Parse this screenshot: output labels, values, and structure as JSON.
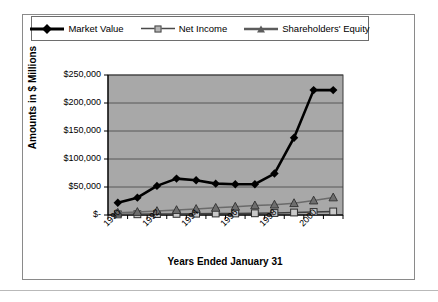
{
  "figure": {
    "legend": [
      {
        "label": "Market Value",
        "marker": "diamond-marker",
        "color": "#000000"
      },
      {
        "label": "Net Income",
        "marker": "square-marker",
        "color": "#b5b5b5"
      },
      {
        "label": "Shareholders' Equity",
        "marker": "triangle-marker",
        "color": "#5c5c5c"
      }
    ],
    "y_axis_title": "Amounts in $ Millions",
    "x_axis_title": "Years Ended January 31",
    "plot_background": "#a8a8a8",
    "gridline_color": "#4f4f4f",
    "frame_color": "#8a8a8a"
  },
  "chart_data": {
    "type": "line",
    "title": "",
    "xlabel": "Years Ended January 31",
    "ylabel": "Amounts in $ Millions",
    "x": [
      1990,
      1991,
      1992,
      1993,
      1994,
      1995,
      1996,
      1997,
      1998,
      1999,
      2000,
      2001
    ],
    "tick_labels_x": [
      "1990",
      "",
      "1992",
      "",
      "1994",
      "",
      "1996",
      "",
      "1998",
      "",
      "2000",
      ""
    ],
    "tick_labels_y": [
      "$-",
      "$50,000",
      "$100,000",
      "$150,000",
      "$200,000",
      "$250,000"
    ],
    "ylim": [
      0,
      250000
    ],
    "ytick_values": [
      0,
      50000,
      100000,
      150000,
      200000,
      250000
    ],
    "grid": true,
    "legend_position": "top",
    "series": [
      {
        "name": "Market Value",
        "marker": "diamond",
        "color": "#000000",
        "values": [
          22000,
          31000,
          52000,
          65000,
          62000,
          56000,
          55000,
          55000,
          74000,
          138000,
          223000,
          223000
        ]
      },
      {
        "name": "Net Income",
        "marker": "square",
        "color": "#b5b5b5",
        "values": [
          1076,
          1291,
          1609,
          1995,
          2333,
          2681,
          2740,
          3056,
          3526,
          4430,
          5377,
          6295
        ]
      },
      {
        "name": "Shareholders' Equity",
        "marker": "triangle",
        "color": "#5c5c5c",
        "values": [
          3966,
          5366,
          6990,
          8759,
          10753,
          12726,
          14756,
          17143,
          18503,
          21112,
          25834,
          31343
        ]
      }
    ]
  }
}
